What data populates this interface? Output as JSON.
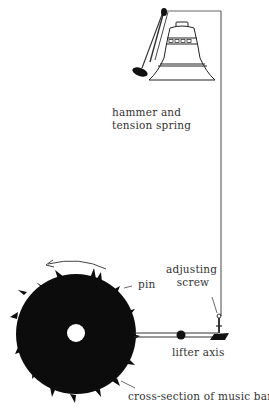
{
  "diagram": {
    "type": "mechanism-illustration",
    "colors": {
      "ink": "#111111",
      "line": "#555555",
      "text": "#333333",
      "background": "#ffffff"
    },
    "labels": {
      "hammer": "hammer and\ntension spring",
      "hammer_line1": "hammer and",
      "hammer_line2": "tension spring",
      "adjusting_line1": "adjusting",
      "adjusting_line2": "screw",
      "pin": "pin",
      "lifter": "lifter axis",
      "barrel": "cross-section of music barrel"
    },
    "components": [
      "bell",
      "hammer",
      "tension spring",
      "wire",
      "adjusting screw",
      "lifter arm",
      "lifter axis",
      "music barrel",
      "pins",
      "rotation arrow"
    ]
  }
}
